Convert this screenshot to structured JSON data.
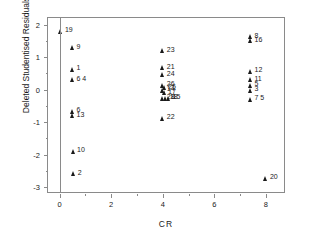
{
  "chart_data": {
    "type": "scatter",
    "title": "",
    "xlabel": "CR",
    "ylabel": "Deleted Studentised Residuals",
    "xlim": [
      -0.45,
      8.7
    ],
    "ylim": [
      -3.15,
      2.2
    ],
    "xticks": [
      0,
      2,
      4,
      6,
      8
    ],
    "xticklabels": [
      "0",
      "2",
      "4",
      "6",
      "8"
    ],
    "yticks": [
      -3,
      -2,
      -1,
      0,
      1,
      2
    ],
    "yticklabels": [
      "-3",
      "-2",
      "-1",
      "0",
      "1",
      "2"
    ],
    "x_minor_ticks": [
      1,
      3,
      5,
      7
    ],
    "y_minor_ticks": [
      -2.5,
      -1.5,
      -0.5,
      0.5,
      1.5
    ],
    "grid": false,
    "legend": false,
    "reference_lines": [
      {
        "orientation": "vertical",
        "x": 0
      }
    ],
    "marker": "triangle",
    "marker_color": "#1a1a1a",
    "point_labels_position": "right",
    "points": [
      {
        "label": "19",
        "x": 0.05,
        "y": 1.8
      },
      {
        "label": "9",
        "x": 0.5,
        "y": 1.28
      },
      {
        "label": "1",
        "x": 0.5,
        "y": 0.62
      },
      {
        "label": "6 4",
        "x": 0.5,
        "y": 0.3
      },
      {
        "label": "6",
        "x": 0.5,
        "y": -0.67
      },
      {
        "label": "13",
        "x": 0.5,
        "y": -0.8
      },
      {
        "label": "10",
        "x": 0.52,
        "y": -1.9
      },
      {
        "label": "2",
        "x": 0.55,
        "y": -2.58
      },
      {
        "label": "23",
        "x": 4.0,
        "y": 1.2
      },
      {
        "label": "21",
        "x": 4.0,
        "y": 0.67
      },
      {
        "label": "24",
        "x": 4.0,
        "y": 0.45
      },
      {
        "label": "26",
        "x": 4.0,
        "y": 0.14
      },
      {
        "label": "25",
        "x": 4.05,
        "y": 0.06
      },
      {
        "label": "14",
        "x": 4.0,
        "y": -0.02
      },
      {
        "label": "17",
        "x": 4.05,
        "y": -0.1
      },
      {
        "label": "28",
        "x": 4.0,
        "y": -0.27
      },
      {
        "label": "18",
        "x": 4.12,
        "y": -0.27
      },
      {
        "label": "15",
        "x": 4.22,
        "y": -0.27
      },
      {
        "label": "22",
        "x": 4.0,
        "y": -0.88
      },
      {
        "label": "8",
        "x": 7.4,
        "y": 1.62
      },
      {
        "label": "16",
        "x": 7.4,
        "y": 1.5
      },
      {
        "label": "12",
        "x": 7.4,
        "y": 0.57
      },
      {
        "label": "11",
        "x": 7.4,
        "y": 0.3
      },
      {
        "label": "5",
        "x": 7.4,
        "y": 0.14
      },
      {
        "label": "3",
        "x": 7.4,
        "y": -0.02
      },
      {
        "label": "7 5",
        "x": 7.4,
        "y": -0.3
      },
      {
        "label": "20",
        "x": 8.0,
        "y": -2.72
      }
    ]
  }
}
